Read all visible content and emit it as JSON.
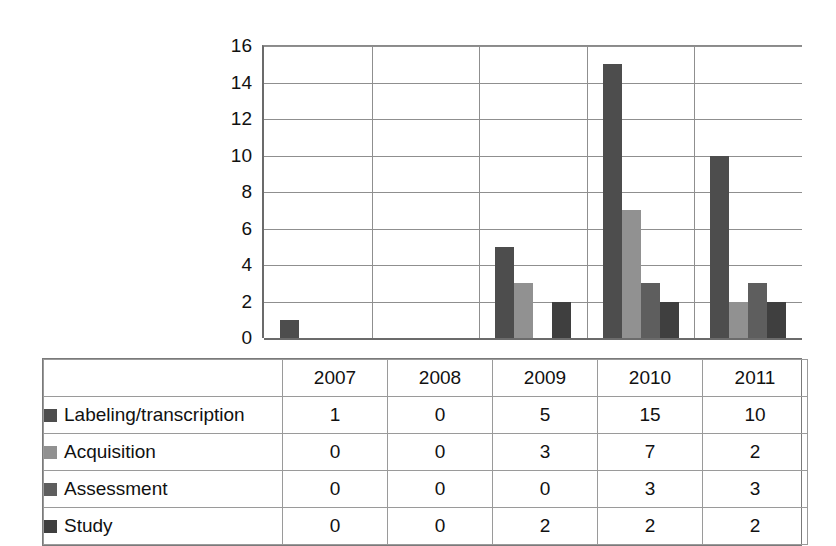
{
  "chart_data": {
    "type": "bar",
    "title": "",
    "xlabel": "",
    "ylabel": "",
    "categories": [
      "2007",
      "2008",
      "2009",
      "2010",
      "2011"
    ],
    "series": [
      {
        "name": "Labeling/transcription",
        "color": "#4d4d4d",
        "values": [
          1,
          0,
          5,
          15,
          10
        ]
      },
      {
        "name": "Acquisition",
        "color": "#919191",
        "values": [
          0,
          0,
          3,
          7,
          2
        ]
      },
      {
        "name": "Assessment",
        "color": "#5e5e5e",
        "values": [
          0,
          0,
          0,
          3,
          3
        ]
      },
      {
        "name": "Study",
        "color": "#3f3f3f",
        "values": [
          0,
          0,
          2,
          2,
          2
        ]
      }
    ],
    "ylim": [
      0,
      16
    ],
    "yticks": [
      "0",
      "2",
      "4",
      "6",
      "8",
      "10",
      "12",
      "14",
      "16"
    ],
    "grid": true,
    "legend_position": "table-left",
    "has_data_table": true
  },
  "table": {
    "header_blank": "",
    "years": [
      "2007",
      "2008",
      "2009",
      "2010",
      "2011"
    ],
    "rows": [
      {
        "label": "Labeling/transcription",
        "swatch": "#4d4d4d",
        "values": [
          "1",
          "0",
          "5",
          "15",
          "10"
        ]
      },
      {
        "label": "Acquisition",
        "swatch": "#919191",
        "values": [
          "0",
          "0",
          "3",
          "7",
          "2"
        ]
      },
      {
        "label": "Assessment",
        "swatch": "#5e5e5e",
        "values": [
          "0",
          "0",
          "0",
          "3",
          "3"
        ]
      },
      {
        "label": "Study",
        "swatch": "#3f3f3f",
        "values": [
          "0",
          "0",
          "2",
          "2",
          "2"
        ]
      }
    ]
  },
  "axis": {
    "y_ticks": [
      "16",
      "14",
      "12",
      "10",
      "8",
      "6",
      "4",
      "2",
      "0"
    ]
  },
  "colors": {
    "grid": "#8f8f8f",
    "axis": "#6b6b6b",
    "text": "#111111",
    "table_border": "#9a9a9a",
    "background": "#ffffff"
  }
}
